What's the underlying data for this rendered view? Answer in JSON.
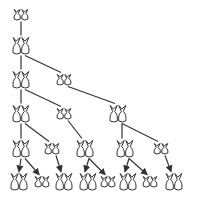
{
  "colors": {
    "line": "#333333",
    "fill": "#ffffff",
    "background": "#ffffff"
  },
  "legend": {
    "large": "adult rabbit pair",
    "small": "young rabbit pair"
  },
  "generations": [
    {
      "month": 1,
      "y": 15,
      "pairs": [
        {
          "x": 21,
          "type": "small"
        }
      ]
    },
    {
      "month": 2,
      "y": 46,
      "pairs": [
        {
          "x": 21,
          "type": "large"
        }
      ]
    },
    {
      "month": 3,
      "y": 80,
      "pairs": [
        {
          "x": 21,
          "type": "large"
        },
        {
          "x": 64,
          "type": "small"
        }
      ]
    },
    {
      "month": 4,
      "y": 114,
      "pairs": [
        {
          "x": 21,
          "type": "large"
        },
        {
          "x": 64,
          "type": "small"
        },
        {
          "x": 118,
          "type": "large"
        }
      ]
    },
    {
      "month": 5,
      "y": 149,
      "pairs": [
        {
          "x": 21,
          "type": "large"
        },
        {
          "x": 52,
          "type": "small"
        },
        {
          "x": 85,
          "type": "large"
        },
        {
          "x": 125,
          "type": "large"
        },
        {
          "x": 161,
          "type": "small"
        }
      ]
    },
    {
      "month": 6,
      "y": 182,
      "pairs": [
        {
          "x": 19,
          "type": "large"
        },
        {
          "x": 42,
          "type": "small"
        },
        {
          "x": 64,
          "type": "large"
        },
        {
          "x": 88,
          "type": "large"
        },
        {
          "x": 108,
          "type": "small"
        },
        {
          "x": 128,
          "type": "large"
        },
        {
          "x": 150,
          "type": "small"
        },
        {
          "x": 174,
          "type": "large"
        }
      ]
    }
  ],
  "edges": [
    {
      "from": [
        0,
        0
      ],
      "to": [
        1,
        0
      ],
      "arrow": false
    },
    {
      "from": [
        1,
        0
      ],
      "to": [
        2,
        0
      ],
      "arrow": false
    },
    {
      "from": [
        1,
        0
      ],
      "to": [
        2,
        1
      ],
      "arrow": false
    },
    {
      "from": [
        2,
        0
      ],
      "to": [
        3,
        0
      ],
      "arrow": false
    },
    {
      "from": [
        2,
        0
      ],
      "to": [
        3,
        1
      ],
      "arrow": false
    },
    {
      "from": [
        2,
        1
      ],
      "to": [
        3,
        2
      ],
      "arrow": false
    },
    {
      "from": [
        3,
        0
      ],
      "to": [
        4,
        0
      ],
      "arrow": false
    },
    {
      "from": [
        3,
        0
      ],
      "to": [
        4,
        1
      ],
      "arrow": false
    },
    {
      "from": [
        3,
        1
      ],
      "to": [
        4,
        2
      ],
      "arrow": false
    },
    {
      "from": [
        3,
        2
      ],
      "to": [
        4,
        3
      ],
      "arrow": false
    },
    {
      "from": [
        3,
        2
      ],
      "to": [
        4,
        4
      ],
      "arrow": false
    },
    {
      "from": [
        4,
        0
      ],
      "to": [
        5,
        0
      ],
      "arrow": true
    },
    {
      "from": [
        4,
        0
      ],
      "to": [
        5,
        1
      ],
      "arrow": true
    },
    {
      "from": [
        4,
        1
      ],
      "to": [
        5,
        2
      ],
      "arrow": true
    },
    {
      "from": [
        4,
        2
      ],
      "to": [
        5,
        3
      ],
      "arrow": true
    },
    {
      "from": [
        4,
        2
      ],
      "to": [
        5,
        4
      ],
      "arrow": true
    },
    {
      "from": [
        4,
        3
      ],
      "to": [
        5,
        5
      ],
      "arrow": true
    },
    {
      "from": [
        4,
        3
      ],
      "to": [
        5,
        6
      ],
      "arrow": true
    },
    {
      "from": [
        4,
        4
      ],
      "to": [
        5,
        7
      ],
      "arrow": true
    }
  ],
  "counts": [
    1,
    1,
    2,
    3,
    5,
    8
  ]
}
